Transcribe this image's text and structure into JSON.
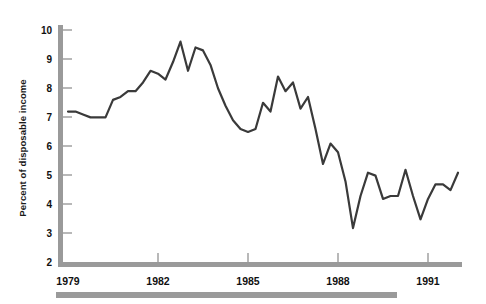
{
  "chart_data": {
    "type": "line",
    "title": "",
    "subtitle": "",
    "xlabel": "",
    "ylabel": "Percent of disposable income",
    "ylim": [
      2,
      10
    ],
    "xlim": [
      1979,
      1992.25
    ],
    "grid": false,
    "legend": null,
    "y_ticks": [
      "2",
      "3",
      "4",
      "5",
      "6",
      "7",
      "8",
      "9",
      "10"
    ],
    "y_tick_values": [
      2,
      3,
      4,
      5,
      6,
      7,
      8,
      9,
      10
    ],
    "x_ticks": [
      "1979",
      "1982",
      "1985",
      "1988",
      "1991"
    ],
    "x_tick_values": [
      1979,
      1982,
      1985,
      1988,
      1991
    ],
    "series": [
      {
        "name": "Percent of disposable income",
        "color": "#3a3a3a",
        "x": [
          1979.0,
          1979.25,
          1979.5,
          1979.75,
          1980.0,
          1980.25,
          1980.5,
          1980.75,
          1981.0,
          1981.25,
          1981.5,
          1981.75,
          1982.0,
          1982.25,
          1982.5,
          1982.75,
          1983.0,
          1983.25,
          1983.5,
          1983.75,
          1984.0,
          1984.25,
          1984.5,
          1984.75,
          1985.0,
          1985.25,
          1985.5,
          1985.75,
          1986.0,
          1986.25,
          1986.5,
          1986.75,
          1987.0,
          1987.25,
          1987.5,
          1987.75,
          1988.0,
          1988.25,
          1988.5,
          1988.75,
          1989.0,
          1989.25,
          1989.5,
          1989.75,
          1990.0,
          1990.25,
          1990.5,
          1990.75,
          1991.0,
          1991.25,
          1991.5,
          1991.75,
          1992.0
        ],
        "y": [
          7.2,
          7.2,
          7.1,
          7.0,
          7.0,
          7.0,
          7.6,
          7.7,
          7.9,
          7.9,
          8.2,
          8.6,
          8.5,
          8.3,
          8.9,
          9.6,
          8.6,
          9.4,
          9.3,
          8.8,
          8.0,
          7.4,
          6.9,
          6.6,
          6.5,
          6.6,
          7.5,
          7.2,
          8.4,
          7.9,
          8.2,
          7.3,
          7.7,
          6.6,
          5.4,
          6.1,
          5.8,
          4.8,
          3.2,
          4.3,
          5.1,
          5.0,
          4.2,
          4.3,
          4.3,
          5.2,
          4.3,
          3.5,
          4.2,
          4.7,
          4.7,
          4.5,
          5.1
        ]
      }
    ],
    "annotations": []
  },
  "axis": {
    "y_label": "Percent of disposable income",
    "y_tick_labels": [
      "10",
      "9",
      "8",
      "7",
      "6",
      "5",
      "4",
      "3",
      "2"
    ],
    "x_tick_labels": [
      "1979",
      "1982",
      "1985",
      "1988",
      "1991"
    ]
  },
  "colors": {
    "line": "#3a3a3a",
    "axis": "#9a9a9a",
    "text": "#111111",
    "background": "#ffffff",
    "footer_bar": "#9a9a9a"
  }
}
